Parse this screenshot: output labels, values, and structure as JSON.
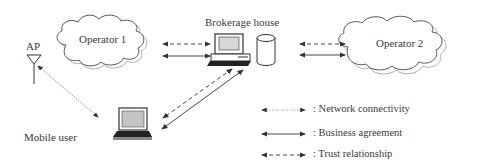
{
  "diagram": {
    "nodes": {
      "operator1": {
        "label": "Operator 1",
        "icon": "cloud-icon"
      },
      "operator2": {
        "label": "Operator  2",
        "icon": "cloud-icon"
      },
      "brokerage": {
        "label": "Brokerage house",
        "icons": [
          "desktop-computer-icon",
          "database-cylinder-icon"
        ]
      },
      "ap": {
        "label": "AP",
        "icon": "antenna-icon"
      },
      "mobile": {
        "label": "Mobile user",
        "icon": "laptop-icon"
      }
    },
    "edges": [
      {
        "from": "Brokerage house",
        "to": "Operator 1",
        "type": "trust"
      },
      {
        "from": "Brokerage house",
        "to": "Operator 1",
        "type": "business"
      },
      {
        "from": "Brokerage house",
        "to": "Operator  2",
        "type": "trust"
      },
      {
        "from": "Brokerage house",
        "to": "Operator  2",
        "type": "business"
      },
      {
        "from": "Brokerage house",
        "to": "Mobile user",
        "type": "trust"
      },
      {
        "from": "Brokerage house",
        "to": "Mobile user",
        "type": "business"
      },
      {
        "from": "AP",
        "to": "Mobile user",
        "type": "network"
      }
    ],
    "legend": [
      {
        "style": "dotted",
        "label": ": Network connectivity"
      },
      {
        "style": "solid",
        "label": ": Business agreement"
      },
      {
        "style": "dashed",
        "label": ": Trust relationship"
      }
    ],
    "colors": {
      "line": "#333333",
      "cloud_outline": "#444444",
      "cloud_shadow": "#aaaaaa",
      "screen": "#bdbdbd"
    }
  }
}
